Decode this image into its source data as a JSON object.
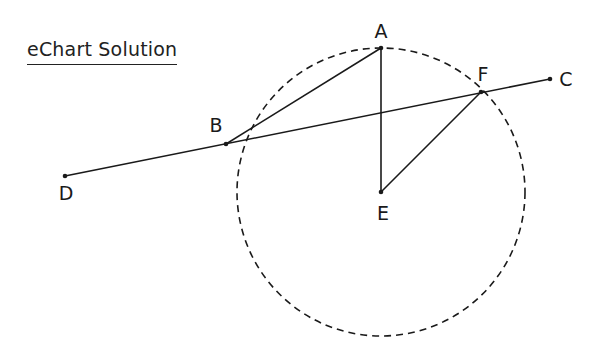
{
  "title": "eChart Solution",
  "diagram": {
    "points": [
      {
        "name": "A",
        "x": 381,
        "y": 48,
        "lx": 381,
        "ly": 38
      },
      {
        "name": "B",
        "x": 226,
        "y": 144,
        "lx": 216,
        "ly": 132
      },
      {
        "name": "C",
        "x": 550,
        "y": 79,
        "lx": 566,
        "ly": 86
      },
      {
        "name": "D",
        "x": 65,
        "y": 176,
        "lx": 66,
        "ly": 200
      },
      {
        "name": "E",
        "x": 381,
        "y": 192,
        "lx": 383,
        "ly": 220
      },
      {
        "name": "F",
        "x": 481,
        "y": 92,
        "lx": 483,
        "ly": 81
      }
    ],
    "segments": [
      [
        "D",
        "C"
      ],
      [
        "B",
        "A"
      ],
      [
        "A",
        "E"
      ],
      [
        "E",
        "F"
      ]
    ],
    "circle": {
      "center": "E",
      "cx": 381,
      "cy": 192,
      "r": 144,
      "style": "dashed"
    }
  }
}
